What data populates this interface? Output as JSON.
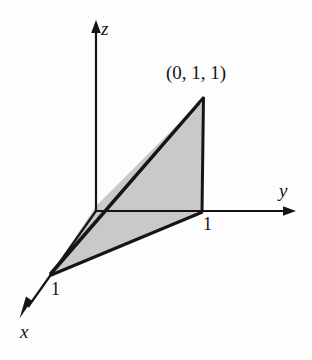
{
  "figure": {
    "kind": "3d-coordinate-axes-diagram",
    "background_color": "#fdfdfd",
    "line_color": "#151515",
    "shade_color": "#c9c9c9",
    "axes": [
      {
        "id": "x",
        "label": "x",
        "label_x": 20,
        "label_y": 322,
        "arrow_from": [
          96,
          211
        ],
        "arrow_to": [
          21,
          317
        ]
      },
      {
        "id": "y",
        "label": "y",
        "label_x": 279,
        "label_y": 181,
        "arrow_from": [
          96,
          211
        ],
        "arrow_to": [
          294,
          211
        ]
      },
      {
        "id": "z",
        "label": "z",
        "label_x": 101,
        "label_y": 19,
        "arrow_from": [
          96,
          211
        ],
        "arrow_to": [
          96,
          23
        ]
      }
    ],
    "tick_labels": [
      {
        "id": "y-tick-one",
        "text": "1",
        "x": 202,
        "y": 216
      },
      {
        "id": "x-tick-one",
        "text": "1",
        "x": 51,
        "y": 281
      }
    ],
    "point_labels": [
      {
        "id": "vertex-point",
        "text": "(0, 1, 1)",
        "x": 167,
        "y": 64
      }
    ],
    "shaded_region": {
      "id": "shaded-triangle",
      "points": "203,99 202,211 51,274 96,206",
      "fill": "#c9c9c9"
    },
    "solid_edges": [
      {
        "id": "edge-apex-to-origin-upper",
        "from": [
          203,
          98
        ],
        "to": [
          50,
          274
        ]
      },
      {
        "id": "edge-apex-to-origin-lower",
        "from": [
          199,
          103
        ],
        "to": [
          50,
          275
        ]
      },
      {
        "id": "edge-apex-right-vertical",
        "from": [
          203,
          98
        ],
        "to": [
          202,
          212
        ]
      },
      {
        "id": "edge-base-front",
        "from": [
          202,
          212
        ],
        "to": [
          50,
          275
        ]
      }
    ],
    "dashed_edges": [
      {
        "id": "edge-hidden-y",
        "from": [
          97,
          211
        ],
        "to": [
          201,
          211
        ],
        "dash": "7,5"
      }
    ]
  }
}
